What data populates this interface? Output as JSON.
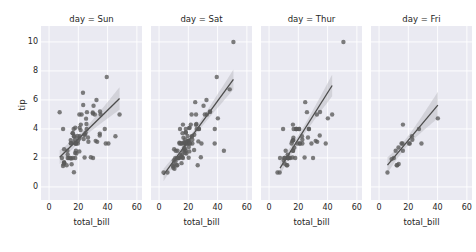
{
  "figure": {
    "background": "#ffffff",
    "panel_background": "#eaeaf2",
    "grid_color": "#ffffff",
    "point_color": "#5a5a5a",
    "line_color": "#4c4c4c",
    "band_color": "#b0b0b8",
    "ylabel": "tip",
    "xlabel": "total_bill",
    "yticks": [
      0,
      2,
      4,
      6,
      8,
      10
    ],
    "xticks": [
      0,
      20,
      40,
      60
    ],
    "xlim": [
      -5.5,
      63.5
    ],
    "ylim": [
      -0.9,
      11.1
    ]
  },
  "chart_data": {
    "type": "scatter",
    "title": "",
    "xlabel": "total_bill",
    "ylabel": "tip",
    "xlim": [
      -5.5,
      63.5
    ],
    "ylim": [
      -0.9,
      11.1
    ],
    "xticks": [
      0,
      20,
      40,
      60
    ],
    "yticks": [
      0,
      2,
      4,
      6,
      8,
      10
    ],
    "grid": true,
    "legend": null,
    "facet_by": "day",
    "facets": [
      {
        "label": "day = Sun",
        "day": "Sun",
        "fit": {
          "slope": 0.0992,
          "intercept": 1.3238,
          "x_start": 7.25,
          "x_end": 48.17
        },
        "points": [
          {
            "x": 16.99,
            "y": 1.01
          },
          {
            "x": 10.34,
            "y": 1.66
          },
          {
            "x": 21.01,
            "y": 3.5
          },
          {
            "x": 23.68,
            "y": 3.31
          },
          {
            "x": 24.59,
            "y": 3.61
          },
          {
            "x": 25.29,
            "y": 4.71
          },
          {
            "x": 8.77,
            "y": 2.0
          },
          {
            "x": 26.88,
            "y": 3.12
          },
          {
            "x": 15.04,
            "y": 1.96
          },
          {
            "x": 14.78,
            "y": 3.23
          },
          {
            "x": 10.27,
            "y": 1.71
          },
          {
            "x": 35.26,
            "y": 5.0
          },
          {
            "x": 15.42,
            "y": 1.57
          },
          {
            "x": 18.43,
            "y": 3.0
          },
          {
            "x": 14.83,
            "y": 3.02
          },
          {
            "x": 21.58,
            "y": 3.92
          },
          {
            "x": 10.33,
            "y": 1.67
          },
          {
            "x": 16.29,
            "y": 3.71
          },
          {
            "x": 16.97,
            "y": 3.5
          },
          {
            "x": 20.65,
            "y": 3.35
          },
          {
            "x": 17.92,
            "y": 4.08
          },
          {
            "x": 39.42,
            "y": 7.58
          },
          {
            "x": 19.82,
            "y": 3.18
          },
          {
            "x": 17.81,
            "y": 2.34
          },
          {
            "x": 13.37,
            "y": 2.0
          },
          {
            "x": 12.69,
            "y": 2.0
          },
          {
            "x": 21.7,
            "y": 4.3
          },
          {
            "x": 19.65,
            "y": 3.0
          },
          {
            "x": 9.55,
            "y": 1.45
          },
          {
            "x": 18.35,
            "y": 2.5
          },
          {
            "x": 15.06,
            "y": 3.0
          },
          {
            "x": 20.69,
            "y": 2.45
          },
          {
            "x": 17.78,
            "y": 3.27
          },
          {
            "x": 24.06,
            "y": 3.6
          },
          {
            "x": 16.31,
            "y": 2.0
          },
          {
            "x": 16.93,
            "y": 3.07
          },
          {
            "x": 18.69,
            "y": 2.31
          },
          {
            "x": 31.27,
            "y": 5.0
          },
          {
            "x": 16.04,
            "y": 3.71
          },
          {
            "x": 30.4,
            "y": 5.6
          },
          {
            "x": 18.29,
            "y": 3.0
          },
          {
            "x": 22.23,
            "y": 5.0
          },
          {
            "x": 32.4,
            "y": 6.0
          },
          {
            "x": 28.55,
            "y": 2.05
          },
          {
            "x": 18.04,
            "y": 3.0
          },
          {
            "x": 12.54,
            "y": 2.5
          },
          {
            "x": 10.29,
            "y": 2.6
          },
          {
            "x": 34.81,
            "y": 5.2
          },
          {
            "x": 9.94,
            "y": 1.56
          },
          {
            "x": 25.56,
            "y": 4.34
          },
          {
            "x": 19.49,
            "y": 3.51
          },
          {
            "x": 38.73,
            "y": 3.0
          },
          {
            "x": 24.27,
            "y": 2.03
          },
          {
            "x": 12.76,
            "y": 2.23
          },
          {
            "x": 30.06,
            "y": 2.0
          },
          {
            "x": 25.89,
            "y": 5.16
          },
          {
            "x": 48.17,
            "y": 5.0
          },
          {
            "x": 29.93,
            "y": 5.07
          },
          {
            "x": 25.71,
            "y": 4.0
          },
          {
            "x": 17.31,
            "y": 3.5
          },
          {
            "x": 29.85,
            "y": 5.14
          },
          {
            "x": 25.0,
            "y": 3.75
          },
          {
            "x": 26.59,
            "y": 3.41
          },
          {
            "x": 38.07,
            "y": 4.0
          },
          {
            "x": 20.69,
            "y": 5.0
          },
          {
            "x": 7.25,
            "y": 5.15
          },
          {
            "x": 31.85,
            "y": 3.18
          },
          {
            "x": 16.82,
            "y": 4.0
          },
          {
            "x": 32.9,
            "y": 3.11
          },
          {
            "x": 17.89,
            "y": 2.0
          },
          {
            "x": 14.48,
            "y": 2.0
          },
          {
            "x": 9.6,
            "y": 4.0
          },
          {
            "x": 34.63,
            "y": 3.55
          },
          {
            "x": 34.65,
            "y": 3.68
          },
          {
            "x": 23.33,
            "y": 5.65
          },
          {
            "x": 45.35,
            "y": 3.5
          },
          {
            "x": 23.17,
            "y": 6.5
          },
          {
            "x": 40.55,
            "y": 3.0
          },
          {
            "x": 20.92,
            "y": 4.08
          },
          {
            "x": 12.03,
            "y": 1.5
          }
        ]
      },
      {
        "label": "day = Sat",
        "day": "Sat",
        "fit": {
          "slope": 0.138,
          "intercept": 0.4035,
          "x_start": 3.07,
          "x_end": 50.81
        },
        "points": [
          {
            "x": 20.29,
            "y": 2.75
          },
          {
            "x": 15.77,
            "y": 2.23
          },
          {
            "x": 39.42,
            "y": 7.58
          },
          {
            "x": 19.82,
            "y": 3.18
          },
          {
            "x": 17.81,
            "y": 2.34
          },
          {
            "x": 13.37,
            "y": 2.0
          },
          {
            "x": 12.69,
            "y": 2.0
          },
          {
            "x": 21.7,
            "y": 4.3
          },
          {
            "x": 19.65,
            "y": 3.0
          },
          {
            "x": 9.55,
            "y": 1.45
          },
          {
            "x": 18.35,
            "y": 2.5
          },
          {
            "x": 15.06,
            "y": 3.0
          },
          {
            "x": 20.69,
            "y": 2.45
          },
          {
            "x": 17.78,
            "y": 3.27
          },
          {
            "x": 24.06,
            "y": 3.6
          },
          {
            "x": 16.31,
            "y": 2.0
          },
          {
            "x": 16.93,
            "y": 3.07
          },
          {
            "x": 18.69,
            "y": 2.31
          },
          {
            "x": 31.27,
            "y": 5.0
          },
          {
            "x": 16.04,
            "y": 3.71
          },
          {
            "x": 17.46,
            "y": 2.54
          },
          {
            "x": 13.94,
            "y": 3.06
          },
          {
            "x": 9.68,
            "y": 1.32
          },
          {
            "x": 30.4,
            "y": 5.6
          },
          {
            "x": 18.29,
            "y": 3.0
          },
          {
            "x": 22.23,
            "y": 5.0
          },
          {
            "x": 32.4,
            "y": 6.0
          },
          {
            "x": 28.55,
            "y": 2.05
          },
          {
            "x": 18.04,
            "y": 3.0
          },
          {
            "x": 12.54,
            "y": 2.5
          },
          {
            "x": 10.29,
            "y": 2.6
          },
          {
            "x": 34.81,
            "y": 5.2
          },
          {
            "x": 9.94,
            "y": 1.56
          },
          {
            "x": 25.56,
            "y": 4.34
          },
          {
            "x": 19.49,
            "y": 3.51
          },
          {
            "x": 38.01,
            "y": 3.0
          },
          {
            "x": 26.41,
            "y": 1.5
          },
          {
            "x": 11.24,
            "y": 1.76
          },
          {
            "x": 48.27,
            "y": 6.73
          },
          {
            "x": 20.29,
            "y": 3.21
          },
          {
            "x": 13.81,
            "y": 2.0
          },
          {
            "x": 11.02,
            "y": 1.98
          },
          {
            "x": 18.29,
            "y": 3.76
          },
          {
            "x": 17.59,
            "y": 2.64
          },
          {
            "x": 20.08,
            "y": 3.15
          },
          {
            "x": 16.45,
            "y": 2.47
          },
          {
            "x": 3.07,
            "y": 1.0
          },
          {
            "x": 20.23,
            "y": 2.01
          },
          {
            "x": 15.01,
            "y": 2.09
          },
          {
            "x": 12.02,
            "y": 1.97
          },
          {
            "x": 17.07,
            "y": 3.0
          },
          {
            "x": 26.86,
            "y": 3.14
          },
          {
            "x": 25.28,
            "y": 5.0
          },
          {
            "x": 14.73,
            "y": 2.2
          },
          {
            "x": 10.51,
            "y": 1.25
          },
          {
            "x": 17.92,
            "y": 3.08
          },
          {
            "x": 27.2,
            "y": 4.0
          },
          {
            "x": 22.76,
            "y": 3.0
          },
          {
            "x": 17.29,
            "y": 2.71
          },
          {
            "x": 19.44,
            "y": 3.0
          },
          {
            "x": 16.66,
            "y": 3.4
          },
          {
            "x": 10.07,
            "y": 1.83
          },
          {
            "x": 32.68,
            "y": 5.0
          },
          {
            "x": 15.98,
            "y": 2.03
          },
          {
            "x": 34.83,
            "y": 5.17
          },
          {
            "x": 13.03,
            "y": 2.0
          },
          {
            "x": 18.28,
            "y": 4.0
          },
          {
            "x": 24.71,
            "y": 5.85
          },
          {
            "x": 21.16,
            "y": 3.0
          },
          {
            "x": 28.97,
            "y": 3.0
          },
          {
            "x": 22.49,
            "y": 3.5
          },
          {
            "x": 5.75,
            "y": 1.0
          },
          {
            "x": 16.32,
            "y": 4.3
          },
          {
            "x": 22.75,
            "y": 3.25
          },
          {
            "x": 40.17,
            "y": 4.73
          },
          {
            "x": 27.28,
            "y": 4.0
          },
          {
            "x": 12.03,
            "y": 1.5
          },
          {
            "x": 21.01,
            "y": 3.0
          },
          {
            "x": 12.46,
            "y": 1.5
          },
          {
            "x": 11.35,
            "y": 2.5
          },
          {
            "x": 15.38,
            "y": 3.0
          },
          {
            "x": 44.3,
            "y": 2.5
          },
          {
            "x": 22.42,
            "y": 3.48
          },
          {
            "x": 20.92,
            "y": 4.08
          },
          {
            "x": 15.36,
            "y": 1.64
          },
          {
            "x": 20.49,
            "y": 4.06
          },
          {
            "x": 25.21,
            "y": 4.29
          },
          {
            "x": 18.24,
            "y": 3.76
          },
          {
            "x": 14.31,
            "y": 4.0
          },
          {
            "x": 14.0,
            "y": 3.0
          },
          {
            "x": 38.07,
            "y": 4.0
          },
          {
            "x": 23.95,
            "y": 2.55
          },
          {
            "x": 25.71,
            "y": 4.0
          },
          {
            "x": 50.81,
            "y": 10.0
          }
        ]
      },
      {
        "label": "day = Thur",
        "day": "Thur",
        "fit": {
          "slope": 0.1602,
          "intercept": 0.0907,
          "x_start": 7.51,
          "x_end": 43.11
        },
        "points": [
          {
            "x": 27.2,
            "y": 4.0
          },
          {
            "x": 22.76,
            "y": 3.0
          },
          {
            "x": 17.29,
            "y": 2.71
          },
          {
            "x": 19.44,
            "y": 3.0
          },
          {
            "x": 16.66,
            "y": 3.4
          },
          {
            "x": 10.07,
            "y": 1.83
          },
          {
            "x": 32.68,
            "y": 5.0
          },
          {
            "x": 15.98,
            "y": 2.03
          },
          {
            "x": 34.83,
            "y": 5.17
          },
          {
            "x": 13.03,
            "y": 2.0
          },
          {
            "x": 18.28,
            "y": 4.0
          },
          {
            "x": 24.71,
            "y": 5.85
          },
          {
            "x": 21.16,
            "y": 3.0
          },
          {
            "x": 28.97,
            "y": 3.0
          },
          {
            "x": 22.49,
            "y": 3.5
          },
          {
            "x": 5.75,
            "y": 1.0
          },
          {
            "x": 16.32,
            "y": 4.3
          },
          {
            "x": 22.75,
            "y": 3.25
          },
          {
            "x": 40.17,
            "y": 4.73
          },
          {
            "x": 27.28,
            "y": 4.0
          },
          {
            "x": 12.03,
            "y": 1.5
          },
          {
            "x": 21.01,
            "y": 3.0
          },
          {
            "x": 12.46,
            "y": 1.5
          },
          {
            "x": 11.35,
            "y": 2.5
          },
          {
            "x": 15.38,
            "y": 3.0
          },
          {
            "x": 7.51,
            "y": 2.0
          },
          {
            "x": 13.0,
            "y": 2.0
          },
          {
            "x": 13.51,
            "y": 2.0
          },
          {
            "x": 18.71,
            "y": 4.0
          },
          {
            "x": 12.74,
            "y": 2.01
          },
          {
            "x": 13.0,
            "y": 2.0
          },
          {
            "x": 16.4,
            "y": 2.5
          },
          {
            "x": 20.53,
            "y": 4.0
          },
          {
            "x": 16.47,
            "y": 3.23
          },
          {
            "x": 26.59,
            "y": 3.41
          },
          {
            "x": 38.73,
            "y": 3.0
          },
          {
            "x": 24.27,
            "y": 2.03
          },
          {
            "x": 12.76,
            "y": 2.23
          },
          {
            "x": 30.06,
            "y": 2.0
          },
          {
            "x": 25.89,
            "y": 5.16
          },
          {
            "x": 43.11,
            "y": 5.0
          },
          {
            "x": 13.0,
            "y": 2.0
          },
          {
            "x": 13.51,
            "y": 2.0
          },
          {
            "x": 18.71,
            "y": 4.0
          },
          {
            "x": 12.74,
            "y": 2.01
          },
          {
            "x": 13.0,
            "y": 2.0
          },
          {
            "x": 16.4,
            "y": 2.5
          },
          {
            "x": 20.53,
            "y": 4.0
          },
          {
            "x": 16.47,
            "y": 3.23
          },
          {
            "x": 10.34,
            "y": 2.0
          },
          {
            "x": 10.59,
            "y": 1.61
          },
          {
            "x": 10.63,
            "y": 2.0
          },
          {
            "x": 50.81,
            "y": 10.0
          },
          {
            "x": 15.81,
            "y": 3.16
          },
          {
            "x": 7.25,
            "y": 1.0
          },
          {
            "x": 31.85,
            "y": 3.18
          },
          {
            "x": 16.82,
            "y": 4.0
          },
          {
            "x": 32.9,
            "y": 3.11
          },
          {
            "x": 17.89,
            "y": 2.0
          },
          {
            "x": 14.48,
            "y": 2.0
          },
          {
            "x": 9.6,
            "y": 4.0
          },
          {
            "x": 34.63,
            "y": 3.55
          }
        ]
      },
      {
        "label": "day = Fri",
        "day": "Fri",
        "fit": {
          "slope": 0.1204,
          "intercept": 0.812,
          "x_start": 5.75,
          "x_end": 40.17
        },
        "points": [
          {
            "x": 28.97,
            "y": 3.0
          },
          {
            "x": 22.49,
            "y": 3.5
          },
          {
            "x": 5.75,
            "y": 1.0
          },
          {
            "x": 16.32,
            "y": 4.3
          },
          {
            "x": 22.75,
            "y": 3.25
          },
          {
            "x": 40.17,
            "y": 4.73
          },
          {
            "x": 27.28,
            "y": 4.0
          },
          {
            "x": 12.03,
            "y": 1.5
          },
          {
            "x": 21.01,
            "y": 3.0
          },
          {
            "x": 12.46,
            "y": 1.5
          },
          {
            "x": 11.35,
            "y": 2.5
          },
          {
            "x": 15.38,
            "y": 3.0
          },
          {
            "x": 13.42,
            "y": 1.58
          },
          {
            "x": 16.27,
            "y": 2.5
          },
          {
            "x": 10.09,
            "y": 2.0
          },
          {
            "x": 20.45,
            "y": 3.0
          },
          {
            "x": 13.28,
            "y": 2.72
          },
          {
            "x": 8.58,
            "y": 1.92
          },
          {
            "x": 15.98,
            "y": 3.0
          }
        ]
      }
    ]
  }
}
